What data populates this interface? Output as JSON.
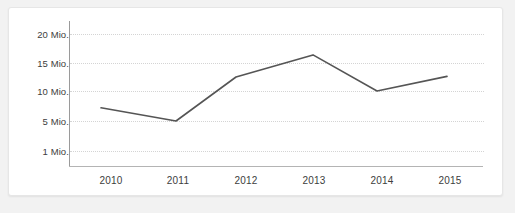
{
  "chart_data": {
    "type": "line",
    "title": "",
    "xlabel": "",
    "ylabel": "",
    "categories": [
      "2010",
      "2011",
      "2012",
      "2013",
      "2014",
      "2015"
    ],
    "series": [
      {
        "name": "",
        "values": [
          7.2,
          5.0,
          12.5,
          16.4,
          10.0,
          12.6
        ]
      }
    ],
    "y_tick_labels": [
      "20 Mio.",
      "15 Mio.",
      "10 Mio.",
      "5 Mio.",
      "1 Mio."
    ],
    "y_tick_values": [
      20,
      15,
      10,
      5,
      1
    ],
    "ylim": [
      1,
      20
    ],
    "grid": "horizontal-dotted",
    "legend": "none",
    "line_color": "#555555",
    "grid_color": "#d4d4d4",
    "axis_color": "#9a9a9a",
    "background_color": "#ffffff"
  },
  "axis": {
    "y_labels": [
      {
        "text": "20 Mio."
      },
      {
        "text": "15 Mio."
      },
      {
        "text": "10 Mio."
      },
      {
        "text": "5 Mio."
      },
      {
        "text": "1 Mio."
      }
    ],
    "x_labels": [
      {
        "text": "2010"
      },
      {
        "text": "2011"
      },
      {
        "text": "2012"
      },
      {
        "text": "2013"
      },
      {
        "text": "2014"
      },
      {
        "text": "2015"
      }
    ]
  }
}
